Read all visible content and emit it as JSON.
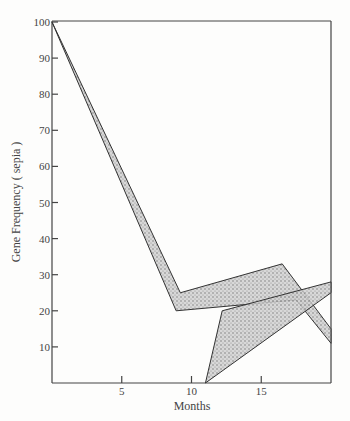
{
  "chart_data": {
    "type": "area",
    "title": "",
    "xlabel": "Months",
    "ylabel": "Gene Frequency (sepia)",
    "xlim": [
      0,
      20
    ],
    "ylim": [
      0,
      100
    ],
    "x_ticks": [
      5,
      10,
      15
    ],
    "y_ticks": [
      10,
      20,
      30,
      40,
      50,
      60,
      70,
      80,
      90,
      100
    ],
    "grid": false,
    "legend": null,
    "series": [
      {
        "name": "Population A (upper band)",
        "style": "stippled band",
        "upper": [
          [
            0,
            100
          ],
          [
            9.2,
            25
          ],
          [
            16.5,
            33
          ],
          [
            20,
            15
          ]
        ],
        "lower": [
          [
            0,
            100
          ],
          [
            8.9,
            20
          ],
          [
            17.5,
            23
          ],
          [
            20,
            11
          ]
        ]
      },
      {
        "name": "Population B (lower band)",
        "style": "stippled band",
        "upper": [
          [
            11,
            0
          ],
          [
            12.2,
            20
          ],
          [
            20,
            28
          ]
        ],
        "lower": [
          [
            11,
            0
          ],
          [
            20,
            25
          ]
        ]
      }
    ]
  },
  "labels": {
    "xlabel": "Months",
    "ylabel": "Gene Frequency ( sepia )",
    "xticks": [
      "5",
      "10",
      "15"
    ],
    "yticks": [
      "10",
      "20",
      "30",
      "40",
      "50",
      "60",
      "70",
      "80",
      "90",
      "100"
    ]
  }
}
